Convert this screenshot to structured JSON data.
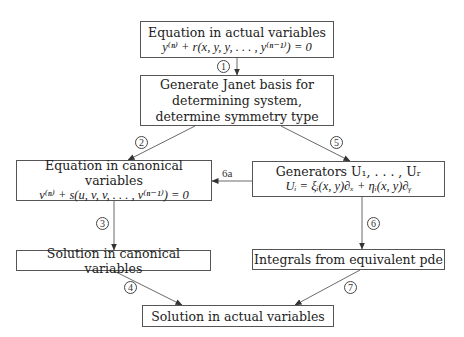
{
  "nodes": {
    "actual_equation": {
      "title": "Equation in actual variables",
      "formula": "y⁽ⁿ⁾ + r(x, y, y, . . . , y⁽ⁿ⁻¹⁾) = 0"
    },
    "janet_basis": {
      "line1": "Generate Janet basis for",
      "line2": "determining system,",
      "line3": "determine symmetry type"
    },
    "canonical_equation": {
      "title": "Equation in canonical variables",
      "formula": "v⁽ⁿ⁾ + s(u, v, v, . . . , v⁽ⁿ⁻¹⁾) = 0"
    },
    "generators": {
      "title": "Generators U₁, . . . , Uᵣ",
      "formula": "Uᵢ = ξᵢ(x, y)∂ₓ + ηᵢ(x, y)∂ᵧ"
    },
    "canonical_solution": {
      "label": "Solution in canonical variables"
    },
    "integrals": {
      "label": "Integrals from equivalent pde"
    },
    "actual_solution": {
      "label": "Solution in actual variables"
    }
  },
  "edges": [
    {
      "from": "actual_equation",
      "to": "janet_basis",
      "label": "1"
    },
    {
      "from": "janet_basis",
      "to": "canonical_equation",
      "label": "2"
    },
    {
      "from": "canonical_equation",
      "to": "canonical_solution",
      "label": "3"
    },
    {
      "from": "canonical_solution",
      "to": "actual_solution",
      "label": "4"
    },
    {
      "from": "janet_basis",
      "to": "generators",
      "label": "5"
    },
    {
      "from": "generators",
      "to": "integrals",
      "label": "6"
    },
    {
      "from": "generators",
      "to": "canonical_equation",
      "label": "6a"
    },
    {
      "from": "integrals",
      "to": "actual_solution",
      "label": "7"
    }
  ]
}
